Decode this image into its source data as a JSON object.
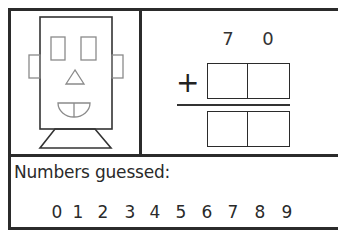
{
  "robot": {
    "parts": [
      "head",
      "left-eye",
      "right-eye",
      "left-ear",
      "right-ear",
      "nose",
      "mouth",
      "neck"
    ]
  },
  "addition": {
    "addend_digits": [
      "7",
      "0"
    ],
    "operator": "+",
    "answer_boxes": 2,
    "addend_boxes": 2
  },
  "guessed": {
    "label": "Numbers guessed:",
    "digits": [
      "0",
      "1",
      "2",
      "3",
      "4",
      "5",
      "6",
      "7",
      "8",
      "9"
    ]
  },
  "colors": {
    "border": "#2b2b2b",
    "drawing": "#8a8a8a",
    "text": "#2a2a2a"
  }
}
